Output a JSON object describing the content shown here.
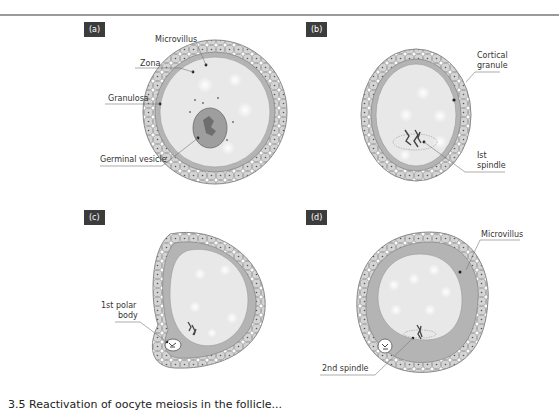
{
  "figure": {
    "panels": [
      {
        "id": "a",
        "label": "(a)",
        "annotations": [
          "Microvillus",
          "Zona",
          "Granulosa",
          "Germinal vesicle"
        ]
      },
      {
        "id": "b",
        "label": "(b)",
        "annotations": [
          "Cortical",
          "granule",
          "Ist",
          "spindle"
        ]
      },
      {
        "id": "c",
        "label": "(c)",
        "annotations": [
          "1st polar",
          "body"
        ]
      },
      {
        "id": "d",
        "label": "(d)",
        "annotations": [
          "Microvillus",
          "2nd spindle"
        ]
      }
    ],
    "caption": "3.5 Reactivation of oocyte meiosis in the follicle..."
  },
  "colors": {
    "cell_fill": "#d4d4d4",
    "cell_stroke": "#8a8a8a",
    "zona_fill": "#b4b4b4",
    "ooplasm_fill": "#e8e8e8",
    "gv_fill": "#9e9e9e",
    "label_bg": "#3c3c3c"
  }
}
